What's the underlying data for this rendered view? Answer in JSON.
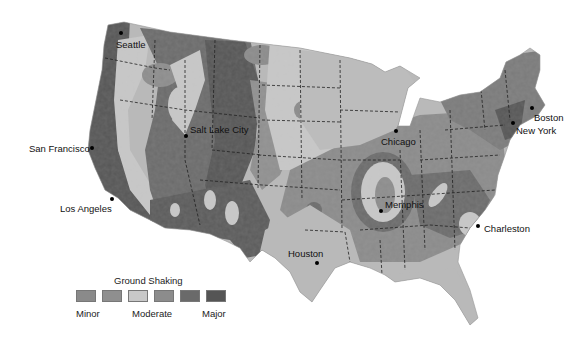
{
  "map": {
    "title": "Ground Shaking",
    "region": "Contiguous United States",
    "colors": {
      "background": "#ffffff",
      "land_base": "#b9b9b9",
      "level_1_minor": "#8a8a8a",
      "level_2": "#8f8f8f",
      "level_3_moderate": "#c8c8c8",
      "level_4": "#8c8c8c",
      "level_5": "#6a6a6a",
      "level_6_major": "#555555",
      "state_border": "#333333"
    },
    "cities": [
      {
        "name": "Seattle",
        "x": 120,
        "y": 33
      },
      {
        "name": "Salt Lake City",
        "x": 186,
        "y": 136
      },
      {
        "name": "San Francisco",
        "x": 92,
        "y": 148
      },
      {
        "name": "Los Angeles",
        "x": 112,
        "y": 199
      },
      {
        "name": "Chicago",
        "x": 396,
        "y": 131
      },
      {
        "name": "Boston",
        "x": 532,
        "y": 108
      },
      {
        "name": "New York",
        "x": 513,
        "y": 123
      },
      {
        "name": "Memphis",
        "x": 381,
        "y": 211
      },
      {
        "name": "Charleston",
        "x": 478,
        "y": 226
      },
      {
        "name": "Houston",
        "x": 317,
        "y": 263
      }
    ]
  },
  "legend": {
    "title": "Ground Shaking",
    "swatches": [
      "#8a8a8a",
      "#8f8f8f",
      "#c8c8c8",
      "#8c8c8c",
      "#6a6a6a",
      "#555555"
    ],
    "labels": {
      "low": "Minor",
      "mid": "Moderate",
      "high": "Major"
    }
  }
}
